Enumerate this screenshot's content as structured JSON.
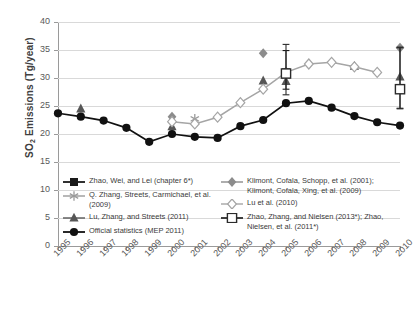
{
  "chart_data": {
    "type": "line",
    "title": "",
    "xlabel": "",
    "ylabel": "SO2 Emissions (Tg/year)",
    "ylabel_html": "SO<sub>2</sub> Emissions (Tg/year)",
    "ylim": [
      0,
      40
    ],
    "ytick_step": 5,
    "yticks": [
      "40",
      "35",
      "30",
      "25",
      "20",
      "15",
      "10",
      "5",
      "0"
    ],
    "ytick_values": [
      40,
      35,
      30,
      25,
      20,
      15,
      10,
      5,
      0
    ],
    "grid": "horizontal",
    "legend_position": "inside-bottom",
    "categories": [
      "1995",
      "1996",
      "1997",
      "1998",
      "1999",
      "2000",
      "2001",
      "2002",
      "2003",
      "2004",
      "2005",
      "2006",
      "2007",
      "2008",
      "2009",
      "2010"
    ],
    "series": [
      {
        "name": "Zhao, Wei, and Lei (chapter 6*)",
        "key": "zhao-wei-lei",
        "marker": "filled-square",
        "color": "#1a1a1a",
        "line": false,
        "error_bars": true,
        "points": [
          {
            "x": "2005",
            "y": 31.0,
            "yerr_low": 28.0,
            "yerr_high": 34.9
          },
          {
            "x": "2010",
            "y": 28.0,
            "yerr_low": 24.5,
            "yerr_high": 35.5
          }
        ]
      },
      {
        "name": "Q. Zhang, Streets, Carmichael, et al. (2009)",
        "key": "q-zhang-streets",
        "marker": "star-x",
        "color": "#9a9a9a",
        "line": false,
        "points": [
          {
            "x": "2001",
            "y": 22.7
          },
          {
            "x": "2005",
            "y": 30.3
          }
        ]
      },
      {
        "name": "Lu, Zhang, and Streets (2011)",
        "key": "lu-zhang-streets",
        "marker": "filled-triangle",
        "color": "#565656",
        "line": false,
        "points": [
          {
            "x": "1996",
            "y": 24.5
          },
          {
            "x": "2000",
            "y": 21.3
          },
          {
            "x": "2004",
            "y": 29.5
          },
          {
            "x": "2005",
            "y": 29.4
          },
          {
            "x": "2008",
            "y": 32.1
          },
          {
            "x": "2010",
            "y": 30.2
          }
        ]
      },
      {
        "name": "Official statistics (MEP 2011)",
        "key": "official-statistics",
        "marker": "filled-circle",
        "color": "#111111",
        "line": true,
        "values": [
          23.7,
          23.1,
          22.4,
          21.1,
          18.6,
          20.0,
          19.5,
          19.3,
          21.4,
          22.5,
          25.5,
          25.9,
          24.7,
          23.2,
          22.1,
          21.5
        ]
      },
      {
        "name": "Klimont, Cofala, Schopp, et al. (2001); Klimont, Cofala, Xing, et al. (2009)",
        "key": "klimont",
        "marker": "filled-diamond",
        "color": "#8c8c8c",
        "line": false,
        "points": [
          {
            "x": "2000",
            "y": 23.1
          },
          {
            "x": "2004",
            "y": 34.4
          },
          {
            "x": "2010",
            "y": 35.4
          }
        ]
      },
      {
        "name": "Lu et al. (2010)",
        "key": "lu-2010",
        "marker": "open-diamond",
        "color": "#a5a5a5",
        "line": true,
        "points": [
          {
            "x": "2000",
            "y": 22.2
          },
          {
            "x": "2001",
            "y": 21.8
          },
          {
            "x": "2002",
            "y": 23.0
          },
          {
            "x": "2003",
            "y": 25.6
          },
          {
            "x": "2004",
            "y": 28.0
          },
          {
            "x": "2005",
            "y": 31.0
          },
          {
            "x": "2006",
            "y": 32.5
          },
          {
            "x": "2007",
            "y": 32.8
          },
          {
            "x": "2008",
            "y": 32.0
          },
          {
            "x": "2009",
            "y": 31.0
          }
        ]
      },
      {
        "name": "Zhao, Zhang, and Nielsen (2013*); Zhao, Nielsen, et al. (2011*)",
        "key": "zhao-zhang-nielsen",
        "marker": "open-square",
        "color": "#2b2b2b",
        "line": false,
        "error_bars": true,
        "points": [
          {
            "x": "2005",
            "y": 30.8,
            "yerr_low": 27.0,
            "yerr_high": 36.0
          },
          {
            "x": "2010",
            "y": 28.0,
            "yerr_low": 24.6,
            "yerr_high": 35.4
          }
        ]
      }
    ]
  },
  "axis": {
    "y_title": "SO2 Emissions (Tg/year)",
    "y_title_main": " Emissions (Tg/year)",
    "y_title_prefix": "SO",
    "y_title_sub": "2"
  },
  "legend": {
    "left_items": [
      {
        "label": "Zhao, Wei, and Lei (chapter 6*)",
        "marker": "filled-square"
      },
      {
        "label": "Q. Zhang, Streets, Carmichael, et al. (2009)",
        "marker": "star-x"
      },
      {
        "label": "Lu, Zhang, and Streets (2011)",
        "marker": "filled-triangle"
      },
      {
        "label": "Official statistics (MEP 2011)",
        "marker": "filled-circle"
      }
    ],
    "right_items": [
      {
        "label": "Klimont, Cofala, Schopp, et al. (2001); Klimont, Cofala, Xing, et al. (2009)",
        "marker": "filled-diamond"
      },
      {
        "label": "Lu et al. (2010)",
        "marker": "open-diamond"
      },
      {
        "label": "Zhao, Zhang, and Nielsen (2013*); Zhao, Nielsen, et al. (2011*)",
        "marker": "open-square"
      }
    ]
  },
  "colors": {
    "grid": "#d9d9d9",
    "axis": "#9a9a9a",
    "black_series": "#111111",
    "grey_series": "#a5a5a5",
    "dark_grey_series": "#565656",
    "text": "#4a4a4a"
  }
}
